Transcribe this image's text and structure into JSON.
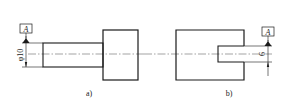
{
  "figures": [
    {
      "caption": "a)",
      "datum_label": "A",
      "dimension": "φ10",
      "description": "Shaft with flange; datum A applied to shaft diameter"
    },
    {
      "caption": "b)",
      "datum_label": "A",
      "dimension": "6",
      "description": "Block with blind hole; datum A applied to hole width"
    }
  ],
  "colors": {
    "line": "#1a1a1a",
    "centerline": "#666666",
    "background": "#ffffff"
  }
}
